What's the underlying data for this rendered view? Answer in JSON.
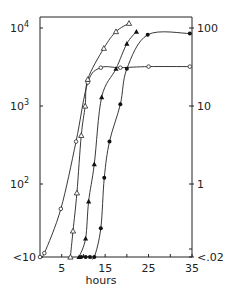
{
  "chart_data": {
    "type": "line",
    "title": "",
    "xlabel": "hours",
    "ylabel_left": "",
    "ylabel_right": "",
    "xlim": [
      0,
      35
    ],
    "ylim_left_log10": [
      0.95,
      4.15
    ],
    "ylim_right_log10": [
      -1.7,
      2.15
    ],
    "y_scale": "log",
    "grid": false,
    "legend": "none",
    "x_ticks": [
      5,
      10,
      15,
      20,
      25,
      30,
      35
    ],
    "x_tick_labels": [
      "5",
      "15",
      "25",
      "35"
    ],
    "x_tick_label_values": [
      5,
      15,
      25,
      35
    ],
    "y_left_tick_labels": [
      {
        "label": "<10",
        "value": 10
      },
      {
        "label": "10",
        "exp": "2",
        "value": 100
      },
      {
        "label": "10",
        "exp": "3",
        "value": 1000
      },
      {
        "label": "10",
        "exp": "4",
        "value": 10000
      }
    ],
    "y_right_tick_labels": [
      {
        "label": "<.02",
        "value": 0.02
      },
      {
        "label": "1",
        "value": 1
      },
      {
        "label": "10",
        "value": 10
      },
      {
        "label": "100",
        "value": 100
      }
    ],
    "series": [
      {
        "name": "open circles",
        "marker": "open-circle",
        "x": [
          0,
          1,
          4.8,
          8.3,
          11,
          14,
          18.5,
          25,
          34.5
        ],
        "y": [
          10,
          13,
          48,
          350,
          2000,
          3100,
          3100,
          3200,
          3200
        ]
      },
      {
        "name": "open triangles",
        "marker": "open-triangle",
        "x": [
          7,
          7.6,
          8.5,
          9.5,
          10.4,
          11,
          14.7,
          17.5,
          20.5
        ],
        "y": [
          10,
          25,
          77,
          420,
          1000,
          2200,
          5500,
          9000,
          11500
        ]
      },
      {
        "name": "filled triangles",
        "marker": "filled-triangle",
        "x": [
          9,
          10.5,
          11.2,
          12.5,
          14.2,
          17.5,
          20,
          22.2
        ],
        "y": [
          10,
          20,
          60,
          180,
          1300,
          3000,
          6300,
          9000
        ]
      },
      {
        "name": "filled circles",
        "marker": "filled-circle",
        "x": [
          9.5,
          10.5,
          11.5,
          12.5,
          14,
          14.8,
          16,
          18.5,
          20,
          24.8,
          34.5
        ],
        "y": [
          10,
          10,
          10,
          10,
          27,
          120,
          350,
          1050,
          3000,
          8200,
          8500
        ]
      }
    ]
  }
}
